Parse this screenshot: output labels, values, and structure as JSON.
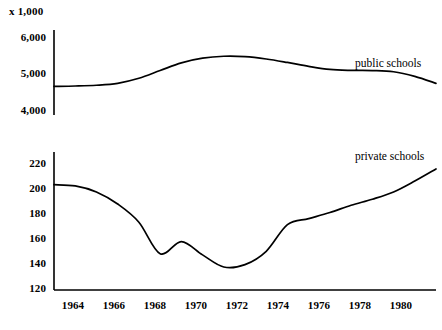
{
  "header": {
    "unit_note": "x 1,000"
  },
  "chart_data": [
    {
      "type": "line",
      "title": "",
      "subtitle": "",
      "xlabel": "",
      "ylabel": "",
      "unit_note": "x 1,000",
      "grid": false,
      "legend_position": "inline-right",
      "axis_style": "left-spine-only",
      "xlim": [
        1963,
        1981
      ],
      "ylim": [
        3900,
        6100
      ],
      "yticks": [
        4000,
        5000,
        6000
      ],
      "ytick_labels": [
        "4,000",
        "5,000",
        "6,000"
      ],
      "xticks": [
        1964,
        1966,
        1968,
        1970,
        1972,
        1974,
        1976,
        1978,
        1980
      ],
      "xtick_labels": [
        "1964",
        "1966",
        "1968",
        "1970",
        "1972",
        "1974",
        "1976",
        "1978",
        "1980"
      ],
      "series": [
        {
          "name": "public schools",
          "color": "#000000",
          "x": [
            1963,
            1964,
            1965,
            1966,
            1967,
            1968,
            1969,
            1970,
            1971,
            1972,
            1973,
            1974,
            1975,
            1976,
            1977,
            1978,
            1979,
            1980,
            1981
          ],
          "values": [
            4640,
            4650,
            4670,
            4720,
            4850,
            5050,
            5250,
            5370,
            5420,
            5410,
            5350,
            5260,
            5160,
            5080,
            5055,
            5050,
            5020,
            4900,
            4720
          ]
        }
      ]
    },
    {
      "type": "line",
      "title": "",
      "subtitle": "",
      "xlabel": "",
      "ylabel": "",
      "grid": false,
      "legend_position": "inline-right",
      "axis_style": "left-and-bottom-spine",
      "xlim": [
        1963,
        1981
      ],
      "ylim": [
        118,
        232
      ],
      "yticks": [
        120,
        140,
        160,
        180,
        200,
        220
      ],
      "ytick_labels": [
        "120",
        "140",
        "160",
        "180",
        "200",
        "220"
      ],
      "xticks": [
        1964,
        1966,
        1968,
        1970,
        1972,
        1974,
        1976,
        1978,
        1980
      ],
      "xtick_labels": [
        "1964",
        "1966",
        "1968",
        "1970",
        "1972",
        "1974",
        "1976",
        "1978",
        "1980"
      ],
      "series": [
        {
          "name": "private schools",
          "color": "#000000",
          "x": [
            1963,
            1964,
            1965,
            1966,
            1967,
            1968,
            1969,
            1970,
            1971,
            1972,
            1973,
            1974,
            1975,
            1976,
            1977,
            1978,
            1979,
            1980,
            1981
          ],
          "values": [
            205,
            204,
            199,
            189,
            174,
            148,
            158,
            147,
            137,
            139,
            150,
            172,
            177,
            182,
            188,
            193,
            199,
            208,
            218
          ]
        }
      ]
    }
  ],
  "top_chart": {
    "yticks": [
      {
        "label": "6,000"
      },
      {
        "label": "5,000"
      },
      {
        "label": "4,000"
      }
    ],
    "series_label": "public schools"
  },
  "bottom_chart": {
    "yticks": [
      {
        "label": "220"
      },
      {
        "label": "200"
      },
      {
        "label": "180"
      },
      {
        "label": "160"
      },
      {
        "label": "140"
      },
      {
        "label": "120"
      }
    ],
    "series_label": "private schools",
    "xticks": [
      {
        "label": "1964"
      },
      {
        "label": "1966"
      },
      {
        "label": "1968"
      },
      {
        "label": "1970"
      },
      {
        "label": "1972"
      },
      {
        "label": "1974"
      },
      {
        "label": "1976"
      },
      {
        "label": "1978"
      },
      {
        "label": "1980"
      }
    ]
  }
}
